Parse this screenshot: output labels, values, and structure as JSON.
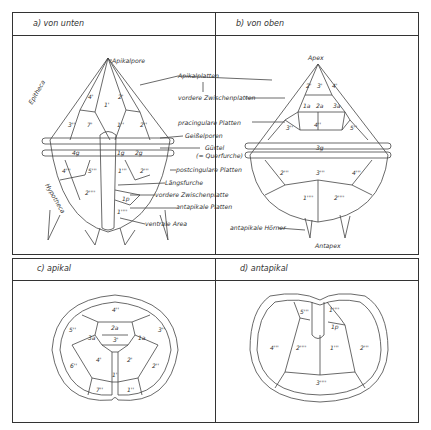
{
  "panels": {
    "a": {
      "title": "a)  von unten"
    },
    "b": {
      "title": "b)  von oben"
    },
    "c": {
      "title": "c)  apikal"
    },
    "d": {
      "title": "d)  antapikal"
    }
  },
  "labels": {
    "apikalpore": "Apikalpore",
    "apikalplatten": "Apikalplatten",
    "vordere_zwischenplatten": "vordere Zwischenplatten",
    "praecingulare_platten": "pracingulare Platten",
    "geisselporen": "Geißelporen",
    "guertel": "Gürtel",
    "querfurche": "(= Querfurche)",
    "postcingulare_platten": "postcingulare Platten",
    "laengsfurche": "Längsfurche",
    "vordere_zwischenplatte": "vordere Zwischenplatte",
    "antapikale_platten": "antapikale Platten",
    "ventrale_area": "ventrale Area",
    "antapikale_hoerner": "antapikale Hörner",
    "epitheca": "Epitheca",
    "hypotheca": "Hypotheca",
    "apex": "Apex",
    "antapex": "Antapex"
  },
  "plates": {
    "a": [
      "4'",
      "1'",
      "2'",
      "3''",
      "7'",
      "1''",
      "2''",
      "4g",
      "1g",
      "2g",
      "4'''",
      "5'''",
      "1'''",
      "2'''",
      "2''''",
      "1p",
      "1''''"
    ],
    "b": [
      "2'",
      "3'",
      "4'",
      "1a",
      "2a",
      "3a",
      "3''",
      "4''",
      "5''",
      "3g",
      "2'''",
      "3'''",
      "4'''",
      "1''''",
      "2''''"
    ],
    "c": [
      "4''",
      "5''",
      "2a",
      "3a",
      "3'",
      "1a",
      "3''",
      "4'",
      "2'",
      "6''",
      "2''",
      "1'",
      "7''",
      "1''"
    ],
    "d": [
      "5'''",
      "1''''",
      "1p",
      "4'''",
      "2''''",
      "1'''",
      "2'''",
      "3''''"
    ]
  }
}
